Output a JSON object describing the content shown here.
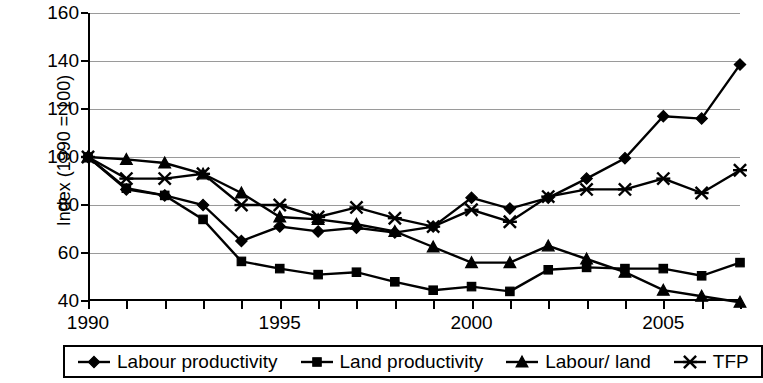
{
  "chart_data": {
    "type": "line",
    "title": "",
    "xlabel": "",
    "ylabel": "Index (1990 = 100)",
    "xlim": [
      1990,
      2007
    ],
    "ylim": [
      40,
      160
    ],
    "yticks": [
      40,
      60,
      80,
      100,
      120,
      140,
      160
    ],
    "xticks_major": [
      1990,
      1995,
      2000,
      2005
    ],
    "xticks_all": [
      1990,
      1991,
      1992,
      1993,
      1994,
      1995,
      1996,
      1997,
      1998,
      1999,
      2000,
      2001,
      2002,
      2003,
      2004,
      2005,
      2006,
      2007
    ],
    "grid": "horizontal",
    "legend_position": "bottom",
    "x": [
      1990,
      1991,
      1992,
      1993,
      1994,
      1995,
      1996,
      1997,
      1998,
      1999,
      2000,
      2001,
      2002,
      2003,
      2004,
      2005,
      2006,
      2007
    ],
    "series": [
      {
        "name": "Labour productivity",
        "marker": "diamond",
        "values": [
          100,
          86.5,
          84,
          80,
          65,
          71,
          69,
          70.5,
          68.5,
          71,
          83,
          78.5,
          83,
          91,
          99.5,
          117,
          116,
          138.5
        ]
      },
      {
        "name": "Land productivity",
        "marker": "square",
        "values": [
          100,
          87,
          84,
          74,
          56.5,
          53.5,
          51,
          52,
          48,
          44.5,
          46,
          44,
          53,
          54,
          53.5,
          53.5,
          50.5,
          56
        ]
      },
      {
        "name": "Labour/ land",
        "marker": "triangle",
        "values": [
          100,
          99,
          97.5,
          93,
          85,
          75,
          74,
          72,
          69,
          62.5,
          56,
          56,
          63,
          57.5,
          52,
          44.5,
          42,
          39.5
        ]
      },
      {
        "name": "TFP",
        "marker": "cross-star",
        "values": [
          100,
          91,
          91,
          93,
          80,
          80,
          75,
          79,
          74.5,
          71,
          78,
          73,
          83.5,
          86.5,
          86.5,
          91,
          85,
          94.5
        ]
      }
    ]
  },
  "legend": {
    "items": [
      {
        "label": "Labour productivity",
        "marker": "diamond"
      },
      {
        "label": "Land productivity",
        "marker": "square"
      },
      {
        "label": "Labour/ land",
        "marker": "triangle"
      },
      {
        "label": "TFP",
        "marker": "cross-star"
      }
    ]
  }
}
